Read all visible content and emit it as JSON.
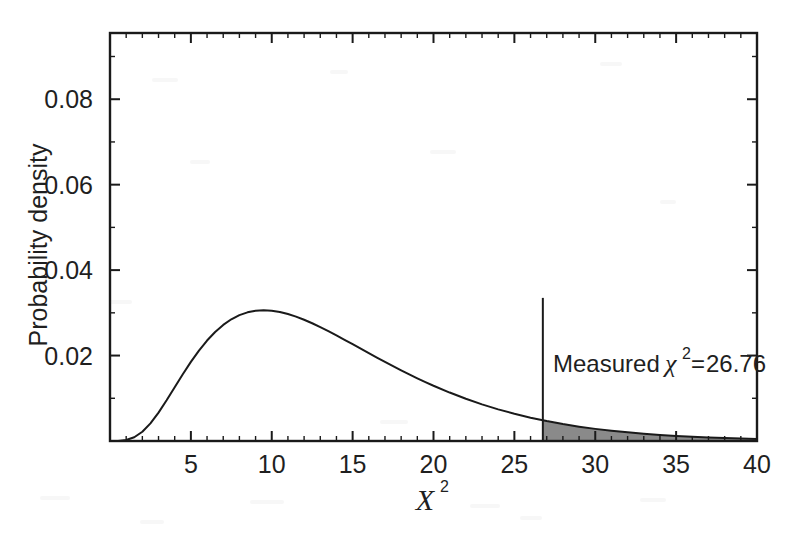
{
  "figure": {
    "name": "chi-squared-distribution-figure",
    "background_color": "#ffffff",
    "ink_color": "#1a1a1a",
    "shade_color": "#8a8a8a"
  },
  "chart_data": {
    "type": "area",
    "title": "",
    "subtitle": "",
    "xlabel": "χ²",
    "ylabel": "Probability density",
    "xlim": [
      0,
      40
    ],
    "ylim": [
      0,
      0.0955
    ],
    "grid": false,
    "legend": null,
    "distribution": {
      "name": "chi-squared probability density",
      "degrees_of_freedom": 14,
      "peak_x": 11.8,
      "peak_y": 0.0808
    },
    "x_ticks_major": [
      5,
      10,
      15,
      20,
      25,
      30,
      35,
      40
    ],
    "x_tick_labels": [
      "5",
      "10",
      "15",
      "20",
      "25",
      "30",
      "35",
      "40"
    ],
    "x_minor_tick_step": 1,
    "y_ticks_major": [
      0.02,
      0.04,
      0.06,
      0.08
    ],
    "y_tick_labels": [
      "0.02",
      "0.04",
      "0.06",
      "0.08"
    ],
    "y_minor_tick_step": 0.01,
    "x": [
      0.0,
      0.5,
      1.0,
      1.5,
      2.0,
      2.5,
      3.0,
      3.5,
      4.0,
      4.5,
      5.0,
      5.5,
      6.0,
      6.5,
      7.0,
      7.5,
      8.0,
      8.5,
      9.0,
      9.5,
      10.0,
      10.5,
      11.0,
      11.5,
      12.0,
      12.5,
      13.0,
      13.5,
      14.0,
      14.5,
      15.0,
      15.5,
      16.0,
      16.5,
      17.0,
      17.5,
      18.0,
      18.5,
      19.0,
      19.5,
      20.0,
      21.0,
      22.0,
      23.0,
      24.0,
      25.0,
      26.0,
      26.76,
      27.0,
      28.0,
      29.0,
      30.0,
      31.0,
      32.0,
      33.0,
      34.0,
      35.0,
      36.0,
      37.0,
      38.0,
      39.0,
      40.0
    ],
    "y": [
      0.0,
      2e-05,
      0.00022,
      0.00087,
      0.00216,
      0.00412,
      0.00664,
      0.00953,
      0.01258,
      0.01562,
      0.01851,
      0.02116,
      0.02351,
      0.02552,
      0.02718,
      0.02849,
      0.02946,
      0.03012,
      0.03049,
      0.03061,
      0.0305,
      0.03019,
      0.02972,
      0.02911,
      0.02838,
      0.02756,
      0.02666,
      0.02571,
      0.02471,
      0.02369,
      0.02265,
      0.02161,
      0.02056,
      0.01953,
      0.01851,
      0.01751,
      0.01654,
      0.01559,
      0.01467,
      0.01379,
      0.01294,
      0.01134,
      0.00989,
      0.00858,
      0.00741,
      0.00637,
      0.00546,
      0.00485,
      0.00466,
      0.00396,
      0.00336,
      0.00284,
      0.0024,
      0.00202,
      0.0017,
      0.00142,
      0.00119,
      0.00099,
      0.00083,
      0.00069,
      0.00057,
      0.00047
    ],
    "shaded_region": {
      "label": "right tail beyond measured value",
      "x_from": 26.76,
      "x_to": 40,
      "fill_color": "#8a8a8a"
    },
    "annotations": [
      {
        "name": "measured-value-annotation",
        "text_prefix": "Measured ",
        "symbol": "χ",
        "superscript": "2",
        "equals": " = ",
        "value": "26.76",
        "full_text": "Measured χ² = 26.76",
        "marker_type": "vertical-line",
        "marker_x": 26.76,
        "marker_y_top": 0.0335,
        "marker_y_bottom": 0.0
      }
    ]
  }
}
